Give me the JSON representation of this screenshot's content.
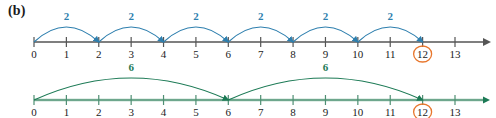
{
  "figure": {
    "panel_label": "(b)",
    "colors": {
      "top_accent": "#2e7fae",
      "bottom_accent": "#1c7a55",
      "axis": "#555555",
      "highlight_circle": "#e8762c",
      "text": "#1a1a1a",
      "background": "#ffffff"
    }
  },
  "chart_data": {
    "type": "line",
    "title": "(b)",
    "xlabel": "",
    "ylabel": "",
    "xlim": [
      0,
      13
    ],
    "grid": false,
    "legend_position": "none",
    "highlight_value": 12,
    "tick_labels": [
      "0",
      "1",
      "2",
      "3",
      "4",
      "5",
      "6",
      "7",
      "8",
      "9",
      "10",
      "11",
      "12",
      "13"
    ],
    "tick_values": [
      0,
      1,
      2,
      3,
      4,
      5,
      6,
      7,
      8,
      9,
      10,
      11,
      12,
      13
    ],
    "series": [
      {
        "name": "skip count by 2",
        "color": "#2e7fae",
        "step": 2,
        "label": "2",
        "start": 0,
        "end": 12,
        "jumps": [
          {
            "from": 0,
            "to": 2,
            "label": "2"
          },
          {
            "from": 2,
            "to": 4,
            "label": "2"
          },
          {
            "from": 4,
            "to": 6,
            "label": "2"
          },
          {
            "from": 6,
            "to": 8,
            "label": "2"
          },
          {
            "from": 8,
            "to": 10,
            "label": "2"
          },
          {
            "from": 10,
            "to": 12,
            "label": "2"
          }
        ]
      },
      {
        "name": "skip count by 6",
        "color": "#1c7a55",
        "step": 6,
        "label": "6",
        "start": 0,
        "end": 12,
        "jumps": [
          {
            "from": 0,
            "to": 6,
            "label": "6"
          },
          {
            "from": 6,
            "to": 12,
            "label": "6"
          }
        ]
      }
    ]
  }
}
